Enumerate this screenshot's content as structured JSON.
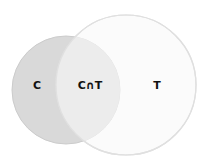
{
  "diagram": {
    "type": "venn",
    "sets": [
      {
        "id": "C",
        "label": "C",
        "fill": "#d9d9d9",
        "stroke": "#c8c8c8"
      },
      {
        "id": "T",
        "label": "T",
        "fill": "#f7f7f7",
        "stroke": "#dcdcdc"
      }
    ],
    "intersection": {
      "label": "C∩T",
      "fill": "#ececec"
    }
  }
}
